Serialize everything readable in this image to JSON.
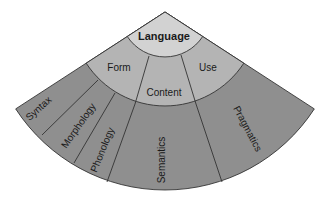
{
  "diagram": {
    "type": "fan-hierarchy",
    "root": {
      "label": "Language"
    },
    "middle_ring": [
      {
        "label": "Form"
      },
      {
        "label": "Content"
      },
      {
        "label": "Use"
      }
    ],
    "outer_ring": [
      {
        "label": "Syntax",
        "parent": "Form"
      },
      {
        "label": "Morphology",
        "parent": "Form"
      },
      {
        "label": "Phonology",
        "parent": "Form"
      },
      {
        "label": "Semantics",
        "parent": "Content"
      },
      {
        "label": "Pragmatics",
        "parent": "Use"
      }
    ],
    "colors": {
      "root_fill": "#d2d2d2",
      "middle_fill": "#b4b4b4",
      "outer_fill": "#8f8f8f",
      "stroke": "#333333",
      "text": "#1a1a1a"
    }
  }
}
